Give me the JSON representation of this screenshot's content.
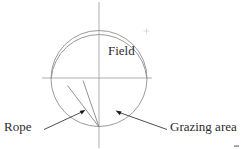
{
  "figure": {
    "background_color": "#ffffff",
    "width": 241,
    "height": 149
  },
  "labels": {
    "field": "Field",
    "rope": "Rope",
    "grazing_area": "Grazing area"
  },
  "geometry": {
    "axis_color": "#9a9a9a",
    "curve_color": "#8e8e8e",
    "leader_color": "#3a3a3a",
    "text_color": "#2b2b2b",
    "origin_x": 99,
    "origin_y": 78,
    "field_radius": 48,
    "rope_anchor_x": 99,
    "rope_anchor_y": 127,
    "rope_length": 48,
    "vertical_axis": {
      "x": 99,
      "y_top": 2,
      "y_bottom": 148
    },
    "horizontal_axis": {
      "y": 78,
      "x_left": 42,
      "x_right": 152
    },
    "grazing_arc": {
      "start_x": 51,
      "start_y": 78,
      "end_x": 148,
      "end_y": 78
    },
    "rope_segment_1": {
      "x1": 99,
      "y1": 127,
      "x2": 68,
      "y2": 86
    },
    "rope_segment_2": {
      "x1": 99,
      "y1": 127,
      "x2": 83,
      "y2": 81
    },
    "rope_arrow_tip": {
      "x": 85,
      "y": 110
    },
    "grazing_arrow_tip": {
      "x": 116,
      "y": 111
    }
  }
}
